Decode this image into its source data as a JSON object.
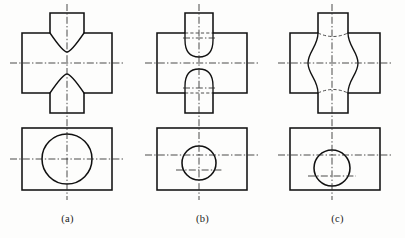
{
  "sheet": {
    "background_color": "#fdfdfc",
    "line_color": "#111111",
    "center_line_color": "#2b2b2b",
    "hidden_line_color": "#3a3a3a",
    "width": 405,
    "height": 238
  },
  "captions": [
    {
      "label": "(a)"
    },
    {
      "label": "(b)"
    },
    {
      "label": "(c)"
    }
  ],
  "figures": [
    {
      "id": "a",
      "caption": "(a)",
      "front_view": {
        "body_rect": {
          "x": 22,
          "y": 33,
          "width": 90,
          "height": 60
        },
        "stub_top": {
          "x": 50,
          "y": 13,
          "width": 34,
          "height": 20
        },
        "stub_bottom": {
          "x": 50,
          "y": 93,
          "width": 34,
          "height": 20
        },
        "intersection_style": "cone-flare-curve",
        "hidden_lines": false
      },
      "top_view": {
        "body_rect": {
          "x": 22,
          "y": 128,
          "width": 90,
          "height": 62
        },
        "circle": {
          "cx": 67,
          "cy": 159,
          "r": 25
        },
        "circle_size": "large"
      },
      "center_lines": {
        "vertical_x": 67,
        "front_horizontal_y": 63,
        "top_horizontal_y": 159
      }
    },
    {
      "id": "b",
      "caption": "(b)",
      "front_view": {
        "body_rect": {
          "x": 157,
          "y": 33,
          "width": 90,
          "height": 60
        },
        "stub_top": {
          "x": 185,
          "y": 13,
          "width": 28,
          "height": 20
        },
        "stub_bottom": {
          "x": 185,
          "y": 93,
          "width": 28,
          "height": 20
        },
        "intersection_style": "convex-arc",
        "hidden_lines": true
      },
      "top_view": {
        "body_rect": {
          "x": 157,
          "y": 128,
          "width": 90,
          "height": 62
        },
        "circle": {
          "cx": 199,
          "cy": 163,
          "r": 17
        },
        "circle_size": "small"
      },
      "center_lines": {
        "vertical_x": 199,
        "front_horizontal_y": 63,
        "top_horizontal_y": 155,
        "top_secondary_y": 163
      }
    },
    {
      "id": "c",
      "caption": "(c)",
      "front_view": {
        "body_rect": {
          "x": 290,
          "y": 33,
          "width": 90,
          "height": 60
        },
        "stub_top": {
          "x": 318,
          "y": 13,
          "width": 30,
          "height": 20
        },
        "stub_bottom": {
          "x": 318,
          "y": 93,
          "width": 30,
          "height": 20
        },
        "intersection_style": "hourglass-waist",
        "hidden_lines": true
      },
      "top_view": {
        "body_rect": {
          "x": 290,
          "y": 128,
          "width": 90,
          "height": 62
        },
        "circle": {
          "cx": 332,
          "cy": 168,
          "r": 18
        },
        "circle_size": "medium"
      },
      "center_lines": {
        "vertical_x": 332,
        "front_horizontal_y": 63,
        "top_horizontal_y": 155,
        "top_secondary_y": 168
      }
    }
  ]
}
